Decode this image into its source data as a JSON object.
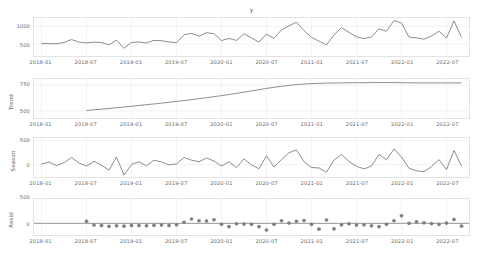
{
  "figure": {
    "title": "y",
    "background": "#ffffff",
    "line_color": "#808080",
    "grid_color": "#ececec",
    "axis_color": "#e3e3e3",
    "tick_text_color": "#6b6b6b"
  },
  "xaxis": {
    "ticks": [
      "2018-01",
      "2018-07",
      "2019-01",
      "2019-07",
      "2020-01",
      "2020-07",
      "2021-01",
      "2021-07",
      "2022-01",
      "2022-07"
    ],
    "tick_positions": [
      0,
      6,
      12,
      18,
      24,
      30,
      36,
      42,
      48,
      54
    ],
    "range": [
      -1,
      57
    ]
  },
  "chart_data": {
    "type": "line",
    "title": "y",
    "xlabel": "",
    "grid": true,
    "legend": "none",
    "x": [
      "2018-01",
      "2018-02",
      "2018-03",
      "2018-04",
      "2018-05",
      "2018-06",
      "2018-07",
      "2018-08",
      "2018-09",
      "2018-10",
      "2018-11",
      "2018-12",
      "2019-01",
      "2019-02",
      "2019-03",
      "2019-04",
      "2019-05",
      "2019-06",
      "2019-07",
      "2019-08",
      "2019-09",
      "2019-10",
      "2019-11",
      "2019-12",
      "2020-01",
      "2020-02",
      "2020-03",
      "2020-04",
      "2020-05",
      "2020-06",
      "2020-07",
      "2020-08",
      "2020-09",
      "2020-10",
      "2020-11",
      "2020-12",
      "2021-01",
      "2021-02",
      "2021-03",
      "2021-04",
      "2021-05",
      "2021-06",
      "2021-07",
      "2021-08",
      "2021-09",
      "2021-10",
      "2021-11",
      "2021-12",
      "2022-01",
      "2022-02",
      "2022-03",
      "2022-04",
      "2022-05",
      "2022-06",
      "2022-07",
      "2022-08",
      "2022-09"
    ],
    "panels": [
      {
        "name": "observed",
        "ylabel": "",
        "title": "y",
        "ytick_values": [
          500,
          1000
        ],
        "ytick_labels": [
          "500",
          "1000"
        ],
        "ylim": [
          170,
          1230
        ],
        "render": "line",
        "values": [
          520,
          516,
          512,
          545,
          628,
          560,
          535,
          556,
          546,
          480,
          612,
          386,
          548,
          560,
          534,
          606,
          596,
          560,
          544,
          762,
          800,
          726,
          820,
          790,
          600,
          660,
          604,
          790,
          672,
          560,
          782,
          666,
          900,
          1010,
          1112,
          880,
          690,
          586,
          480,
          760,
          960,
          830,
          706,
          656,
          700,
          930,
          860,
          1160,
          1090,
          700,
          676,
          640,
          730,
          860,
          672,
          1150,
          690
        ]
      },
      {
        "name": "trend",
        "ylabel": "Trend",
        "title": "",
        "ytick_values": [
          500,
          750
        ],
        "ytick_labels": [
          "500",
          "750"
        ],
        "ylim": [
          430,
          810
        ],
        "render": "line",
        "values": [
          470,
          null,
          null,
          null,
          null,
          null,
          503,
          510,
          516,
          523,
          530,
          537,
          545,
          552,
          560,
          567,
          575,
          583,
          592,
          600,
          609,
          618,
          628,
          638,
          648,
          659,
          670,
          682,
          694,
          706,
          718,
          729,
          739,
          748,
          755,
          761,
          765,
          768,
          770,
          771,
          772,
          773,
          774,
          774,
          775,
          775,
          775,
          775,
          774,
          773,
          772,
          772,
          772,
          772,
          772,
          772,
          772
        ]
      },
      {
        "name": "season",
        "ylabel": "Season",
        "title": "",
        "ytick_values": [
          0,
          500
        ],
        "ytick_labels": [
          "0",
          "500"
        ],
        "ylim": [
          -260,
          560
        ],
        "render": "line",
        "values": [
          10,
          55,
          -20,
          40,
          150,
          35,
          -30,
          70,
          -10,
          -115,
          160,
          -220,
          5,
          60,
          -25,
          95,
          55,
          -5,
          15,
          150,
          95,
          60,
          140,
          75,
          -30,
          60,
          -60,
          120,
          -5,
          -85,
          185,
          -50,
          105,
          250,
          310,
          60,
          -60,
          -70,
          -160,
          95,
          215,
          65,
          -35,
          -90,
          -30,
          215,
          100,
          330,
          160,
          -75,
          -130,
          -150,
          -40,
          105,
          -105,
          300,
          -30
        ]
      },
      {
        "name": "resid",
        "ylabel": "Resid",
        "title": "",
        "ytick_values": [
          0,
          500
        ],
        "ytick_labels": [
          "0",
          "500"
        ],
        "ylim": [
          -230,
          480
        ],
        "render": "scatter",
        "marker": "circle",
        "zero_line": true,
        "values": [
          null,
          null,
          null,
          null,
          null,
          null,
          40,
          -35,
          -45,
          -60,
          -50,
          -55,
          -45,
          -45,
          -50,
          -40,
          -35,
          -45,
          -30,
          20,
          85,
          50,
          45,
          70,
          -20,
          -65,
          -10,
          -15,
          -20,
          -65,
          -130,
          -20,
          50,
          5,
          40,
          55,
          -20,
          -115,
          65,
          -110,
          -30,
          -10,
          -35,
          -30,
          -50,
          -65,
          -20,
          50,
          150,
          0,
          30,
          10,
          -5,
          -20,
          5,
          75,
          -55
        ]
      }
    ]
  }
}
